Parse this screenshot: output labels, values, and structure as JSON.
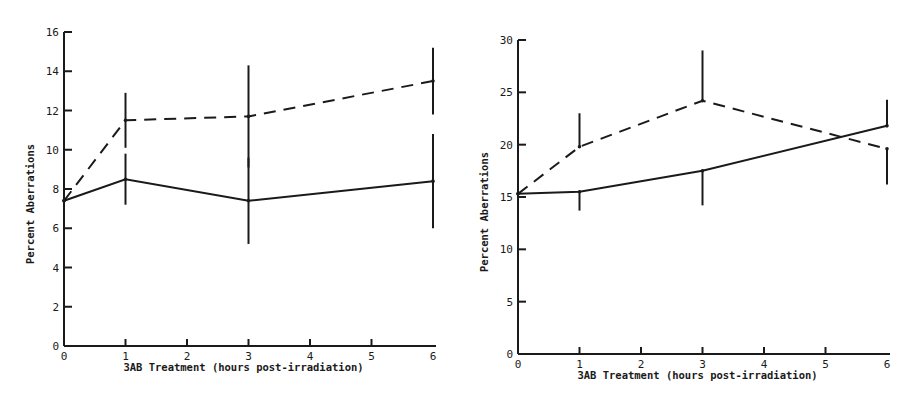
{
  "chart_data": [
    {
      "type": "line",
      "title": "",
      "xlabel": "3AB Treatment (hours post-irradiation)",
      "ylabel": "Percent Aberrations",
      "x": [
        0,
        1,
        3,
        6
      ],
      "xticks": [
        0,
        1,
        2,
        3,
        4,
        5,
        6
      ],
      "yticks": [
        0,
        2,
        4,
        6,
        8,
        10,
        12,
        14,
        16
      ],
      "ylim": [
        0,
        16
      ],
      "xlim": [
        0,
        6
      ],
      "grid": false,
      "legend": null,
      "series": [
        {
          "name": "solid",
          "style": "solid",
          "values": [
            7.4,
            8.5,
            7.4,
            8.4
          ],
          "error": [
            0,
            1.3,
            2.2,
            2.4
          ]
        },
        {
          "name": "dashed",
          "style": "dashed",
          "values": [
            7.4,
            11.5,
            11.7,
            13.5
          ],
          "error": [
            0,
            1.4,
            2.6,
            1.7
          ]
        }
      ]
    },
    {
      "type": "line",
      "title": "",
      "xlabel": "3AB Treatment (hours post-irradiation)",
      "ylabel": "Percent Aberrations",
      "x": [
        0,
        1,
        3,
        6
      ],
      "xticks": [
        0,
        1,
        2,
        3,
        4,
        5,
        6
      ],
      "yticks": [
        0,
        5,
        10,
        15,
        20,
        25,
        30
      ],
      "ylim": [
        0,
        30
      ],
      "xlim": [
        0,
        6
      ],
      "grid": false,
      "legend": null,
      "series": [
        {
          "name": "solid",
          "style": "solid",
          "values": [
            15.3,
            15.5,
            17.5,
            21.8
          ],
          "error_down": [
            0,
            1.8,
            3.3,
            0
          ],
          "error_up": [
            0,
            0,
            0,
            2.5
          ]
        },
        {
          "name": "dashed",
          "style": "dashed",
          "values": [
            15.3,
            19.8,
            24.2,
            19.6
          ],
          "error_up": [
            0,
            3.2,
            4.8,
            0
          ],
          "error_down": [
            0,
            0,
            0,
            3.4
          ]
        }
      ]
    }
  ]
}
